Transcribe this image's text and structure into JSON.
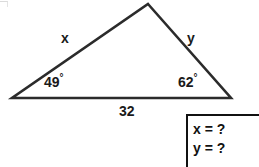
{
  "figure": {
    "type": "triangle-diagram",
    "background_color": "#ffffff",
    "stroke_color": "#2b2b2b",
    "text_color": "#1a1a1a"
  },
  "triangle": {
    "vertices": {
      "apex": {
        "x": 148,
        "y": 4
      },
      "bottom_left": {
        "x": 12,
        "y": 98
      },
      "bottom_right": {
        "x": 231,
        "y": 98
      }
    },
    "angles": {
      "left": {
        "value": "49",
        "unit": "°",
        "full": "49°"
      },
      "right": {
        "value": "62",
        "unit": "°",
        "full": "62°"
      }
    },
    "sides": {
      "left": "x",
      "right": "y",
      "base": "32"
    }
  },
  "answer_box": {
    "lines": [
      "x = ?",
      "y = ?"
    ],
    "border_color": "#111111"
  }
}
